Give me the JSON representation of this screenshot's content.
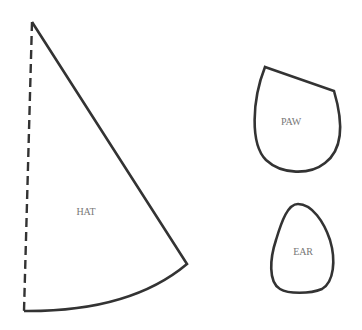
{
  "diagram": {
    "type": "craft-template-pattern",
    "colors": {
      "stroke": "#333333",
      "label": "#777777",
      "background": "#ffffff"
    },
    "pieces": [
      {
        "id": "hat",
        "label": "HAT",
        "label_pos": [
          86,
          211
        ],
        "shape": "cone-sector",
        "fold_edge": "dashed-left-edge"
      },
      {
        "id": "paw",
        "label": "PAW",
        "label_pos": [
          291,
          121
        ],
        "shape": "rounded-teardrop"
      },
      {
        "id": "ear",
        "label": "EAR",
        "label_pos": [
          303,
          251
        ],
        "shape": "egg"
      }
    ]
  }
}
